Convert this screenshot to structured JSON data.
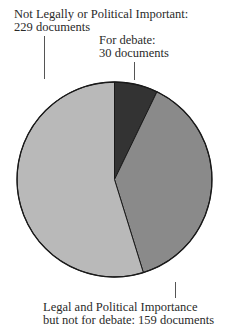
{
  "chart_data": {
    "type": "pie",
    "title": "",
    "start_angle_deg": 0,
    "direction": "clockwise",
    "slices": [
      {
        "label": "For debate",
        "value": 30,
        "unit": "documents",
        "color": "#333333",
        "label_lines": [
          "For debate:",
          "30 documents"
        ]
      },
      {
        "label": "Legal and Political Importance but not for debate",
        "value": 159,
        "unit": "documents",
        "color": "#8a8a8a",
        "label_lines": [
          "Legal and Political Importance",
          "but not for debate: 159 documents"
        ]
      },
      {
        "label": "Not Legally or Political Important",
        "value": 229,
        "unit": "documents",
        "color": "#b9b9b9",
        "label_lines": [
          "Not Legally or Political Important:",
          "229 documents"
        ]
      }
    ],
    "total": 418,
    "legend": "none (direct labels with leader lines)"
  },
  "labels": {
    "not_legal": {
      "line1": "Not Legally or Political Important:",
      "line2": "229 documents"
    },
    "debate": {
      "line1": "For debate:",
      "line2": "30 documents"
    },
    "legal": {
      "line1": "Legal and Political Importance",
      "line2": "but not for debate: 159 documents"
    }
  },
  "style": {
    "outline_color": "#1a1a1a",
    "leader_color": "#555555"
  }
}
